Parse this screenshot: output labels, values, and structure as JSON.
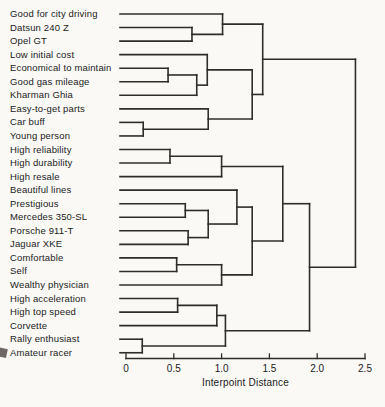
{
  "figure": {
    "kind": "hierarchical-clustering-dendrogram",
    "background_color": "#faf9f6",
    "line_color": "#2f2d2b",
    "text_color": "#1b1b1b"
  },
  "axis": {
    "label": "Interpoint Distance",
    "ticks": [
      "0",
      "0.5",
      "1.0",
      "1.5",
      "2.0",
      "2.5"
    ],
    "tick_values": [
      0,
      0.5,
      1.0,
      1.5,
      2.0,
      2.5
    ]
  },
  "chart_data": {
    "type": "dendrogram",
    "orientation": "horizontal",
    "xlabel": "Interpoint Distance",
    "xlim": [
      0,
      2.5
    ],
    "grid": false,
    "leaves": [
      "Good for city driving",
      "Datsun 240 Z",
      "Opel GT",
      "Low initial cost",
      "Economical to maintain",
      "Good gas mileage",
      "Kharman Ghia",
      "Easy-to-get parts",
      "Car buff",
      "Young person",
      "High reliability",
      "High durability",
      "High resale",
      "Beautiful lines",
      "Prestigious",
      "Mercedes 350-SL",
      "Porsche 911-T",
      "Jaguar XKE",
      "Comfortable",
      "Self",
      "Wealthy physician",
      "High acceleration",
      "High top speed",
      "Corvette",
      "Rally enthusiast",
      "Amateur racer"
    ],
    "tree": {
      "d": 2.4,
      "children": [
        {
          "d": 1.43,
          "children": [
            {
              "d": 1.01,
              "children": [
                {
                  "leaf": 0
                },
                {
                  "d": 0.69,
                  "children": [
                    {
                      "leaf": 1
                    },
                    {
                      "leaf": 2
                    }
                  ]
                }
              ]
            },
            {
              "d": 1.32,
              "children": [
                {
                  "d": 0.85,
                  "children": [
                    {
                      "leaf": 3
                    },
                    {
                      "d": 0.74,
                      "children": [
                        {
                          "d": 0.44,
                          "children": [
                            {
                              "leaf": 4
                            },
                            {
                              "leaf": 5
                            }
                          ]
                        },
                        {
                          "leaf": 6
                        }
                      ]
                    }
                  ]
                },
                {
                  "d": 0.86,
                  "children": [
                    {
                      "leaf": 7
                    },
                    {
                      "d": 0.18,
                      "children": [
                        {
                          "leaf": 8
                        },
                        {
                          "leaf": 9
                        }
                      ]
                    }
                  ]
                }
              ]
            }
          ]
        },
        {
          "d": 1.92,
          "children": [
            {
              "d": 1.64,
              "children": [
                {
                  "d": 1.0,
                  "children": [
                    {
                      "d": 0.46,
                      "children": [
                        {
                          "leaf": 10
                        },
                        {
                          "leaf": 11
                        }
                      ]
                    },
                    {
                      "leaf": 12
                    }
                  ]
                },
                {
                  "d": 1.32,
                  "children": [
                    {
                      "d": 1.16,
                      "children": [
                        {
                          "leaf": 13
                        },
                        {
                          "d": 0.86,
                          "children": [
                            {
                              "d": 0.62,
                              "children": [
                                {
                                  "leaf": 14
                                },
                                {
                                  "leaf": 15
                                }
                              ]
                            },
                            {
                              "d": 0.65,
                              "children": [
                                {
                                  "leaf": 16
                                },
                                {
                                  "leaf": 17
                                }
                              ]
                            }
                          ]
                        }
                      ]
                    },
                    {
                      "d": 1.0,
                      "children": [
                        {
                          "d": 0.53,
                          "children": [
                            {
                              "leaf": 18
                            },
                            {
                              "leaf": 19
                            }
                          ]
                        },
                        {
                          "leaf": 20
                        }
                      ]
                    }
                  ]
                }
              ]
            },
            {
              "d": 1.04,
              "children": [
                {
                  "d": 0.95,
                  "children": [
                    {
                      "d": 0.54,
                      "children": [
                        {
                          "leaf": 21
                        },
                        {
                          "leaf": 22
                        }
                      ]
                    },
                    {
                      "leaf": 23
                    }
                  ]
                },
                {
                  "d": 0.17,
                  "children": [
                    {
                      "leaf": 24
                    },
                    {
                      "leaf": 25
                    }
                  ]
                }
              ]
            }
          ]
        }
      ]
    }
  }
}
